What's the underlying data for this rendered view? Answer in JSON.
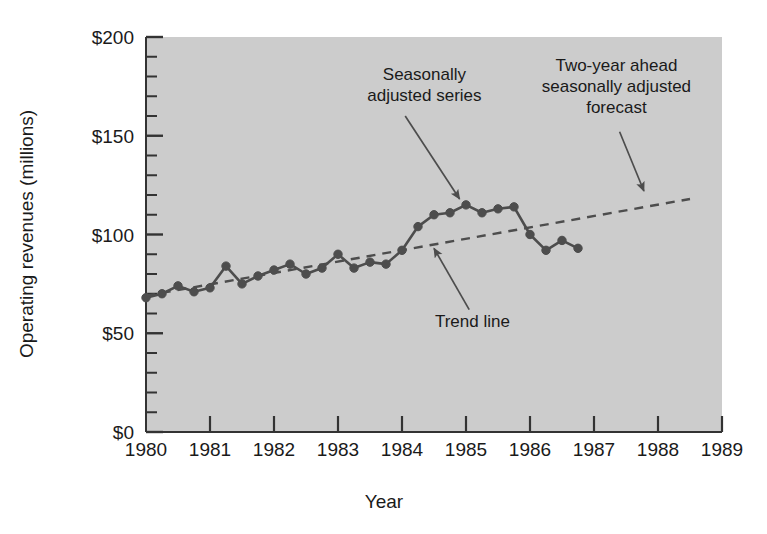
{
  "chart_data": {
    "type": "line",
    "title": "",
    "xlabel": "Year",
    "ylabel": "Operating revenues (millions)",
    "xlim": [
      1980,
      1989
    ],
    "ylim": [
      0,
      200
    ],
    "grid": false,
    "legend_position": "none",
    "x_tick_labels": [
      "1980",
      "1981",
      "1982",
      "1983",
      "1984",
      "1985",
      "1986",
      "1987",
      "1988",
      "1989"
    ],
    "x_ticks": [
      1980,
      1981,
      1982,
      1983,
      1984,
      1985,
      1986,
      1987,
      1988,
      1989
    ],
    "y_tick_labels": [
      "$0",
      "$50",
      "$100",
      "$150",
      "$200"
    ],
    "y_ticks": [
      0,
      50,
      100,
      150,
      200
    ],
    "y_minor_tick_step": 10,
    "series": [
      {
        "name": "Seasonally adjusted series",
        "style": "solid-with-markers",
        "color": "#4d4d4d",
        "x": [
          1980.0,
          1980.25,
          1980.5,
          1980.75,
          1981.0,
          1981.25,
          1981.5,
          1981.75,
          1982.0,
          1982.25,
          1982.5,
          1982.75,
          1983.0,
          1983.25,
          1983.5,
          1983.75,
          1984.0,
          1984.25,
          1984.5,
          1984.75,
          1985.0,
          1985.25,
          1985.5,
          1985.75,
          1986.0,
          1986.25,
          1986.5,
          1986.75
        ],
        "values": [
          68,
          70,
          74,
          71,
          73,
          84,
          75,
          79,
          82,
          85,
          80,
          83,
          90,
          83,
          86,
          85,
          92,
          104,
          110,
          111,
          115,
          111,
          113,
          114,
          100,
          92,
          97,
          93
        ]
      },
      {
        "name": "Trend line",
        "style": "dashed",
        "color": "#4d4d4d",
        "x": [
          1980.0,
          1988.5
        ],
        "values": [
          69,
          118
        ]
      }
    ],
    "annotations": [
      {
        "id": "seasonally-adjusted-series",
        "lines": [
          "Seasonally",
          "adjusted series"
        ],
        "text_x": 1984.35,
        "text_y": 178,
        "arrow_from_x": 1984.05,
        "arrow_from_y": 160,
        "arrow_to_x": 1984.9,
        "arrow_to_y": 118
      },
      {
        "id": "two-year-ahead-forecast",
        "lines": [
          "Two-year ahead",
          "seasonally adjusted",
          "forecast"
        ],
        "text_x": 1987.35,
        "text_y": 183,
        "arrow_from_x": 1987.4,
        "arrow_from_y": 152,
        "arrow_to_x": 1987.78,
        "arrow_to_y": 122
      },
      {
        "id": "trend-line",
        "lines": [
          "Trend line"
        ],
        "text_x": 1985.1,
        "text_y": 53,
        "arrow_from_x": 1985.05,
        "arrow_from_y": 62,
        "arrow_to_x": 1984.5,
        "arrow_to_y": 93
      }
    ]
  },
  "figure": {
    "plot_background_color": "#cccccc",
    "page_background_color": "#ffffff",
    "axis_color": "#333333",
    "data_color": "#4d4d4d"
  }
}
